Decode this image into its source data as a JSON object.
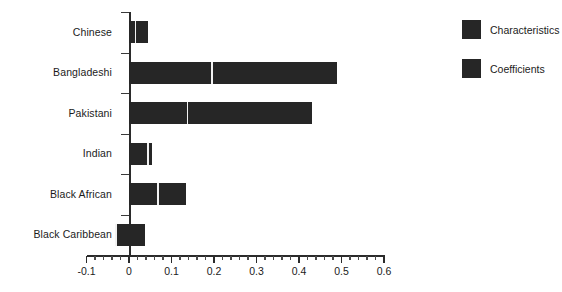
{
  "chart_data": {
    "type": "bar",
    "orientation": "horizontal",
    "title": "",
    "subtitle": "",
    "xlabel": "",
    "ylabel": "",
    "categories": [
      "Chinese",
      "Bangladeshi",
      "Pakistani",
      "Indian",
      "Black African",
      "Black Caribbean"
    ],
    "series": [
      {
        "name": "Characteristics",
        "color": "#262626",
        "values": [
          0.015,
          0.195,
          0.138,
          0.045,
          0.068,
          -0.031
        ]
      },
      {
        "name": "Coefficients",
        "color": "#262626",
        "values": [
          0.03,
          0.295,
          0.292,
          0.01,
          0.065,
          0.068
        ]
      }
    ],
    "totals": [
      0.045,
      0.49,
      0.43,
      0.055,
      0.133,
      0.037
    ],
    "stacked": true,
    "xlim": [
      -0.1,
      0.6
    ],
    "xticks": [
      -0.1,
      0,
      0.1,
      0.2,
      0.3,
      0.4,
      0.5,
      0.6
    ],
    "xticklabels": [
      "-0.1",
      "0",
      "0.1",
      "0.2",
      "0.3",
      "0.4",
      "0.5",
      "0.6"
    ],
    "minor_ticks_per_interval": 5,
    "grid": false,
    "legend_position": "right"
  },
  "legend": {
    "items": [
      {
        "label": "Characteristics",
        "color": "#262626"
      },
      {
        "label": "Coefficients",
        "color": "#262626"
      }
    ]
  },
  "colors": {
    "bar": "#262626",
    "axis": "#2b2b2b",
    "text": "#1b1b1b",
    "background": "#ffffff"
  }
}
